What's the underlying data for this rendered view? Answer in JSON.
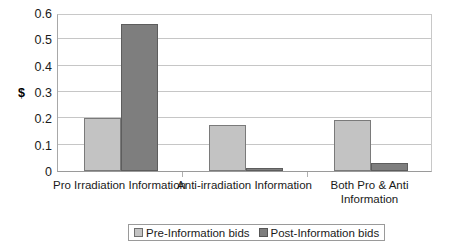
{
  "chart_data": {
    "type": "bar",
    "title": "",
    "xlabel": "",
    "ylabel": "$",
    "ylim": [
      0,
      0.6
    ],
    "ytick_labels": [
      "0",
      "0.1",
      "0.2",
      "0.3",
      "0.4",
      "0.5",
      "0.6"
    ],
    "ytick_values": [
      0,
      0.1,
      0.2,
      0.3,
      0.4,
      0.5,
      0.6
    ],
    "grid": true,
    "legend_position": "bottom",
    "categories": [
      "Pro Irradiation Information",
      "Anti-irradiation Information",
      "Both Pro & Anti\nInformation"
    ],
    "series": [
      {
        "name": "Pre-Information bids",
        "color": "#c3c3c3",
        "values": [
          0.2,
          0.176,
          0.193
        ]
      },
      {
        "name": "Post-Information bids",
        "color": "#7e7e7e",
        "values": [
          0.558,
          0.013,
          0.032
        ]
      }
    ]
  },
  "axis": {
    "y_label": "$"
  },
  "legend": {
    "items": [
      {
        "label": "Pre-Information bids"
      },
      {
        "label": "Post-Information bids"
      }
    ]
  }
}
